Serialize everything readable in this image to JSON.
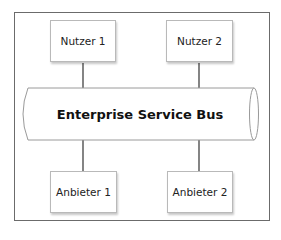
{
  "diagram": {
    "type": "architecture",
    "bus": {
      "label": "Enterprise Service Bus"
    },
    "consumers": [
      {
        "label": "Nutzer 1"
      },
      {
        "label": "Nutzer 2"
      }
    ],
    "providers": [
      {
        "label": "Anbieter 1"
      },
      {
        "label": "Anbieter 2"
      }
    ],
    "edges": [
      {
        "from": "Nutzer 1",
        "to": "Enterprise Service Bus"
      },
      {
        "from": "Nutzer 2",
        "to": "Enterprise Service Bus"
      },
      {
        "from": "Enterprise Service Bus",
        "to": "Anbieter 1"
      },
      {
        "from": "Enterprise Service Bus",
        "to": "Anbieter 2"
      }
    ],
    "colors": {
      "frame": "#6b6b6b",
      "box_border": "#b9b9b9",
      "bus_outline": "#9a9a9a",
      "connector": "#333333"
    }
  }
}
